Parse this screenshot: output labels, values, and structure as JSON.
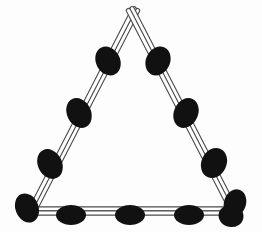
{
  "figure": {
    "background_color": "#fdfdfd",
    "canvas": {
      "width": 262,
      "height": 232
    },
    "strand": {
      "name": "double-line-strand",
      "stroke_color": "#4a4a4a",
      "fill_color": "#ffffff",
      "outer_width": 5.4,
      "inner_width": 3.2,
      "rail_gap_px": 4
    },
    "bead": {
      "name": "oval-bead",
      "color": "#111111",
      "shape": "ellipse",
      "count_total": 11
    },
    "vertices": [
      {
        "name": "apex",
        "label": "Apex",
        "x": 133,
        "y": 15
      },
      {
        "name": "bottom-left",
        "label": "Bottom Left",
        "x": 32,
        "y": 211
      },
      {
        "name": "bottom-right",
        "label": "Bottom Right",
        "x": 234,
        "y": 211
      }
    ],
    "edges": [
      {
        "name": "left-edge",
        "label": "Left Edge",
        "from": "apex",
        "to": "bottom-left",
        "bead_count": 3
      },
      {
        "name": "right-edge",
        "label": "Right Edge",
        "from": "apex",
        "to": "bottom-right",
        "bead_count": 3
      },
      {
        "name": "bottom-edge",
        "label": "Bottom Edge",
        "from": "bottom-left",
        "to": "bottom-right",
        "bead_count": 3
      }
    ],
    "beads": [
      {
        "name": "bead-left-1",
        "edge": "left-edge",
        "cx": 108,
        "cy": 61,
        "rx": 12,
        "ry": 15,
        "rotation": -28
      },
      {
        "name": "bead-left-2",
        "edge": "left-edge",
        "cx": 79,
        "cy": 113,
        "rx": 12,
        "ry": 15.5,
        "rotation": -26
      },
      {
        "name": "bead-left-3",
        "edge": "left-edge",
        "cx": 50,
        "cy": 164,
        "rx": 12,
        "ry": 15.5,
        "rotation": -27
      },
      {
        "name": "bead-corner-bottom-left",
        "edge": "bottom-left",
        "cx": 27,
        "cy": 208,
        "rx": 11.5,
        "ry": 15,
        "rotation": -22
      },
      {
        "name": "bead-bottom-1",
        "edge": "bottom-edge",
        "cx": 71,
        "cy": 215,
        "rx": 15,
        "ry": 10,
        "rotation": 0
      },
      {
        "name": "bead-bottom-2",
        "edge": "bottom-edge",
        "cx": 130,
        "cy": 215,
        "rx": 15,
        "ry": 10,
        "rotation": 0
      },
      {
        "name": "bead-bottom-3",
        "edge": "bottom-edge",
        "cx": 189,
        "cy": 215,
        "rx": 15,
        "ry": 10,
        "rotation": 0
      },
      {
        "name": "bead-corner-bottom-right-upper",
        "edge": "bottom-right",
        "cx": 235,
        "cy": 203,
        "rx": 11,
        "ry": 14,
        "rotation": 18
      },
      {
        "name": "bead-corner-bottom-right-lower",
        "edge": "bottom-right",
        "cx": 231,
        "cy": 216,
        "rx": 12.5,
        "ry": 11,
        "rotation": 10
      },
      {
        "name": "bead-right-1",
        "edge": "right-edge",
        "cx": 158,
        "cy": 61,
        "rx": 12,
        "ry": 15,
        "rotation": 26
      },
      {
        "name": "bead-right-2",
        "edge": "right-edge",
        "cx": 186,
        "cy": 113,
        "rx": 12,
        "ry": 15.5,
        "rotation": 25
      },
      {
        "name": "bead-right-3",
        "edge": "right-edge",
        "cx": 214,
        "cy": 163,
        "rx": 12.5,
        "ry": 15.5,
        "rotation": 25
      }
    ]
  }
}
